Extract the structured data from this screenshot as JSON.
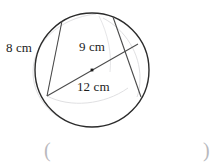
{
  "figure": {
    "type": "circle-with-chords",
    "title": "",
    "circle": {
      "center_x": 92,
      "center_y": 70,
      "radius": 57,
      "stroke": "#2b2b2b",
      "center_dot": true
    },
    "labels": {
      "chord_left": "8 cm",
      "chord_right": "9 cm",
      "diameter": "12 cm"
    },
    "segments": [
      {
        "name": "chord-8cm",
        "label": "8 cm",
        "x1": 62,
        "y1": 21,
        "x2": 47,
        "y2": 96,
        "stroke": "#4a4a4a"
      },
      {
        "name": "diameter-12cm",
        "label": "12 cm",
        "x1": 47,
        "y1": 96,
        "x2": 138,
        "y2": 44,
        "stroke": "#4a4a4a"
      },
      {
        "name": "chord-9cm",
        "label": "9 cm",
        "x1": 113,
        "y1": 17,
        "x2": 141,
        "y2": 97,
        "stroke": "#4a4a4a"
      }
    ],
    "construction_arcs": [
      {
        "name": "faint-arc-left",
        "stroke": "#dcdcdc"
      },
      {
        "name": "faint-arc-lower",
        "stroke": "#dcdcdc"
      },
      {
        "name": "faint-arc-right",
        "stroke": "#dcdcdc"
      },
      {
        "name": "faint-arc-upper",
        "stroke": "#dcdcdc"
      }
    ],
    "answer_field": {
      "open_paren": "(",
      "close_paren": ")"
    },
    "colors": {
      "ink": "#2b2b2b",
      "light_ink": "#4a4a4a",
      "faint": "#dcdcdc",
      "paren": "#b9b9bd",
      "background": "#ffffff"
    }
  }
}
